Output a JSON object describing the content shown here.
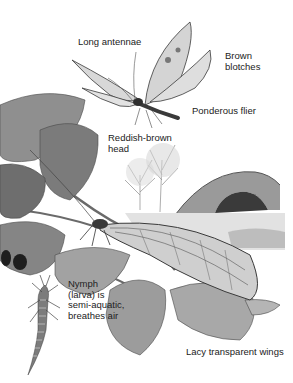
{
  "illustration": {
    "subject": "Alderfly",
    "style": "grayscale pencil illustration",
    "labels": [
      {
        "id": "long-antennae",
        "text": "Long antennae",
        "x": 78,
        "y": 37
      },
      {
        "id": "brown-blotches",
        "text": "Brown\nblotches",
        "x": 225,
        "y": 51
      },
      {
        "id": "ponderous-flier",
        "text": "Ponderous flier",
        "x": 192,
        "y": 106
      },
      {
        "id": "reddish-brown-head",
        "text": "Reddish-brown\nhead",
        "x": 108,
        "y": 133
      },
      {
        "id": "nymph",
        "text": "Nymph\n(larva) is\nsemi-aquatic,\nbreathes air",
        "x": 68,
        "y": 279
      },
      {
        "id": "lacy-wings",
        "text": "Lacy transparent wings",
        "x": 186,
        "y": 347
      }
    ],
    "elements": [
      "flying alderfly",
      "resting alderfly on leaf",
      "alder branch with leaves",
      "stone arch bridge",
      "bare trees",
      "river",
      "nymph larva"
    ]
  }
}
